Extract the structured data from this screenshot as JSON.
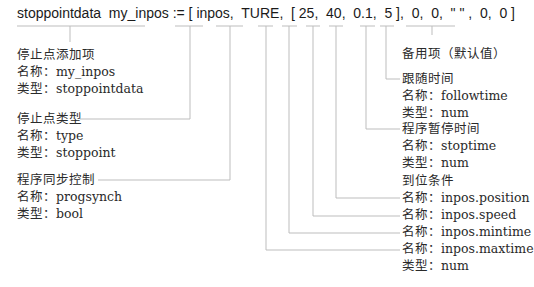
{
  "code": "stoppointdata  my_inpos := [ inpos,  TURE,  [ 25,  40,  0.1,  5 ],  0,  0,  \" \" ,  0,  0 ]",
  "annotations": {
    "stoppoint_item": {
      "title": "停止点添加项",
      "name": "名称：my_inpos",
      "type": "类型：stoppointdata"
    },
    "stoppoint_type": {
      "title": "停止点类型",
      "name": "名称：type",
      "type": "类型：stoppoint"
    },
    "progsynch": {
      "title": "程序同步控制",
      "name": "名称：progsynch",
      "type": "类型：bool"
    },
    "spare": {
      "title": "备用项（默认值）"
    },
    "followtime": {
      "title": "跟随时间",
      "name": "名称：followtime",
      "type": "类型：num"
    },
    "stoptime": {
      "title": "程序暂停时间",
      "name": "名称：stoptime",
      "type": "类型：num"
    },
    "inpos": {
      "title": "到位条件",
      "names": [
        "名称：inpos.position",
        "名称：inpos.speed",
        "名称：inpos.mintime",
        "名称：inpos.maxtime"
      ],
      "type": "类型：num"
    }
  }
}
